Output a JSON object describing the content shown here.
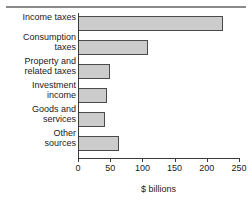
{
  "chart_data": {
    "type": "bar",
    "orientation": "horizontal",
    "title": "",
    "xlabel": "$ billions",
    "ylabel": "",
    "xlim": [
      0,
      250
    ],
    "xticks": [
      0,
      50,
      100,
      150,
      200,
      250
    ],
    "grid": false,
    "legend": null,
    "bar_color": "#cccccc",
    "bar_edge_color": "#4a4a4a",
    "categories": [
      "Income taxes",
      "Consumption taxes",
      "Property and related taxes",
      "Investment income",
      "Goods and services",
      "Other sources"
    ],
    "category_lines": [
      [
        "Income taxes",
        ""
      ],
      [
        "Consumption",
        "taxes"
      ],
      [
        "Property and",
        "related taxes"
      ],
      [
        "Investment",
        "income"
      ],
      [
        "Goods and",
        "services"
      ],
      [
        "Other",
        "sources"
      ]
    ],
    "values": [
      225,
      109,
      50,
      45,
      42,
      63
    ]
  }
}
